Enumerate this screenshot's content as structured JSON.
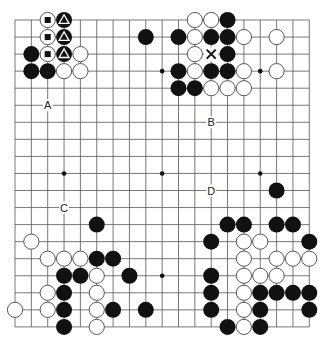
{
  "board": {
    "size": 19,
    "origin_px": [
      15,
      20
    ],
    "spacing_px": [
      16.35,
      17.05
    ],
    "stone_radius_px": 8,
    "colors": {
      "line": "#555555",
      "black": "#111111",
      "white": "#ffffff",
      "white_stroke": "#444444",
      "background": "#ffffff"
    },
    "star_points": [
      [
        3,
        3
      ],
      [
        9,
        3
      ],
      [
        15,
        3
      ],
      [
        3,
        9
      ],
      [
        9,
        9
      ],
      [
        15,
        9
      ],
      [
        3,
        15
      ],
      [
        9,
        15
      ],
      [
        15,
        15
      ]
    ],
    "stones": [
      {
        "c": 2,
        "r": 0,
        "color": "white",
        "mark": "square"
      },
      {
        "c": 3,
        "r": 0,
        "color": "black",
        "mark": "triangle"
      },
      {
        "c": 2,
        "r": 1,
        "color": "white",
        "mark": "square"
      },
      {
        "c": 3,
        "r": 1,
        "color": "black",
        "mark": "triangle"
      },
      {
        "c": 1,
        "r": 2,
        "color": "black"
      },
      {
        "c": 2,
        "r": 2,
        "color": "white",
        "mark": "square"
      },
      {
        "c": 3,
        "r": 2,
        "color": "black",
        "mark": "triangle"
      },
      {
        "c": 4,
        "r": 2,
        "color": "white"
      },
      {
        "c": 1,
        "r": 3,
        "color": "black"
      },
      {
        "c": 2,
        "r": 3,
        "color": "black"
      },
      {
        "c": 3,
        "r": 3,
        "color": "white"
      },
      {
        "c": 4,
        "r": 3,
        "color": "white"
      },
      {
        "c": 11,
        "r": 0,
        "color": "white"
      },
      {
        "c": 12,
        "r": 0,
        "color": "white"
      },
      {
        "c": 13,
        "r": 0,
        "color": "black"
      },
      {
        "c": 8,
        "r": 1,
        "color": "black"
      },
      {
        "c": 10,
        "r": 1,
        "color": "black"
      },
      {
        "c": 11,
        "r": 1,
        "color": "white"
      },
      {
        "c": 12,
        "r": 1,
        "color": "black"
      },
      {
        "c": 13,
        "r": 1,
        "color": "black"
      },
      {
        "c": 14,
        "r": 1,
        "color": "white"
      },
      {
        "c": 16,
        "r": 1,
        "color": "white"
      },
      {
        "c": 11,
        "r": 2,
        "color": "white"
      },
      {
        "c": 13,
        "r": 2,
        "color": "black"
      },
      {
        "c": 10,
        "r": 3,
        "color": "black"
      },
      {
        "c": 11,
        "r": 3,
        "color": "white"
      },
      {
        "c": 12,
        "r": 3,
        "color": "black"
      },
      {
        "c": 13,
        "r": 3,
        "color": "black"
      },
      {
        "c": 14,
        "r": 3,
        "color": "white"
      },
      {
        "c": 16,
        "r": 3,
        "color": "white"
      },
      {
        "c": 10,
        "r": 4,
        "color": "black"
      },
      {
        "c": 11,
        "r": 4,
        "color": "black"
      },
      {
        "c": 12,
        "r": 4,
        "color": "white"
      },
      {
        "c": 13,
        "r": 4,
        "color": "white"
      },
      {
        "c": 14,
        "r": 4,
        "color": "white"
      },
      {
        "c": 16,
        "r": 10,
        "color": "black"
      },
      {
        "c": 5,
        "r": 12,
        "color": "black"
      },
      {
        "c": 1,
        "r": 13,
        "color": "white"
      },
      {
        "c": 2,
        "r": 14,
        "color": "white"
      },
      {
        "c": 3,
        "r": 14,
        "color": "white"
      },
      {
        "c": 4,
        "r": 14,
        "color": "white"
      },
      {
        "c": 5,
        "r": 14,
        "color": "black"
      },
      {
        "c": 6,
        "r": 14,
        "color": "black"
      },
      {
        "c": 3,
        "r": 15,
        "color": "black"
      },
      {
        "c": 4,
        "r": 15,
        "color": "black"
      },
      {
        "c": 5,
        "r": 15,
        "color": "white"
      },
      {
        "c": 7,
        "r": 15,
        "color": "black"
      },
      {
        "c": 2,
        "r": 16,
        "color": "white"
      },
      {
        "c": 3,
        "r": 16,
        "color": "black"
      },
      {
        "c": 5,
        "r": 16,
        "color": "white"
      },
      {
        "c": 0,
        "r": 17,
        "color": "white"
      },
      {
        "c": 2,
        "r": 17,
        "color": "white"
      },
      {
        "c": 3,
        "r": 17,
        "color": "black"
      },
      {
        "c": 5,
        "r": 17,
        "color": "white"
      },
      {
        "c": 6,
        "r": 17,
        "color": "black"
      },
      {
        "c": 8,
        "r": 17,
        "color": "black"
      },
      {
        "c": 3,
        "r": 18,
        "color": "black"
      },
      {
        "c": 5,
        "r": 18,
        "color": "white"
      },
      {
        "c": 13,
        "r": 12,
        "color": "black"
      },
      {
        "c": 14,
        "r": 12,
        "color": "black"
      },
      {
        "c": 16,
        "r": 12,
        "color": "black"
      },
      {
        "c": 17,
        "r": 12,
        "color": "black"
      },
      {
        "c": 12,
        "r": 13,
        "color": "black"
      },
      {
        "c": 14,
        "r": 13,
        "color": "white"
      },
      {
        "c": 15,
        "r": 13,
        "color": "white"
      },
      {
        "c": 18,
        "r": 13,
        "color": "black"
      },
      {
        "c": 14,
        "r": 14,
        "color": "white"
      },
      {
        "c": 16,
        "r": 14,
        "color": "white"
      },
      {
        "c": 17,
        "r": 14,
        "color": "white"
      },
      {
        "c": 18,
        "r": 14,
        "color": "white"
      },
      {
        "c": 12,
        "r": 15,
        "color": "black"
      },
      {
        "c": 14,
        "r": 15,
        "color": "white"
      },
      {
        "c": 15,
        "r": 15,
        "color": "white"
      },
      {
        "c": 16,
        "r": 15,
        "color": "white"
      },
      {
        "c": 12,
        "r": 16,
        "color": "black"
      },
      {
        "c": 14,
        "r": 16,
        "color": "white"
      },
      {
        "c": 15,
        "r": 16,
        "color": "black"
      },
      {
        "c": 16,
        "r": 16,
        "color": "black"
      },
      {
        "c": 17,
        "r": 16,
        "color": "black"
      },
      {
        "c": 18,
        "r": 16,
        "color": "black"
      },
      {
        "c": 12,
        "r": 17,
        "color": "black"
      },
      {
        "c": 14,
        "r": 17,
        "color": "white"
      },
      {
        "c": 15,
        "r": 17,
        "color": "black"
      },
      {
        "c": 18,
        "r": 17,
        "color": "black"
      },
      {
        "c": 13,
        "r": 18,
        "color": "black"
      },
      {
        "c": 14,
        "r": 18,
        "color": "white"
      },
      {
        "c": 15,
        "r": 18,
        "color": "black"
      }
    ],
    "markers": [
      {
        "c": 12,
        "r": 2,
        "type": "cross"
      }
    ],
    "labels": [
      {
        "c": 2,
        "r": 5,
        "text": "A"
      },
      {
        "c": 12,
        "r": 6,
        "text": "B"
      },
      {
        "c": 3,
        "r": 11,
        "text": "C"
      },
      {
        "c": 12,
        "r": 10,
        "text": "D"
      }
    ]
  }
}
